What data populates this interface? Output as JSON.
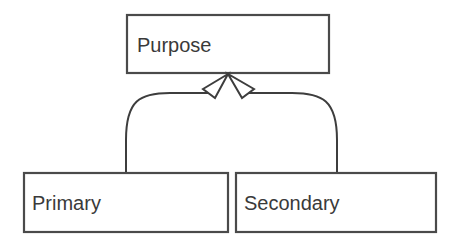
{
  "diagram": {
    "type": "class-hierarchy",
    "nodes": [
      {
        "id": "purpose",
        "label": "Purpose",
        "role": "parent"
      },
      {
        "id": "primary",
        "label": "Primary",
        "role": "child"
      },
      {
        "id": "secondary",
        "label": "Secondary",
        "role": "child"
      }
    ],
    "edges": [
      {
        "from": "primary",
        "to": "purpose",
        "style": "generalization-hollow-triangle"
      },
      {
        "from": "secondary",
        "to": "purpose",
        "style": "generalization-hollow-triangle"
      }
    ],
    "colors": {
      "stroke": "#4a4a4a",
      "text": "#3a3a3a",
      "background": "#ffffff"
    }
  }
}
